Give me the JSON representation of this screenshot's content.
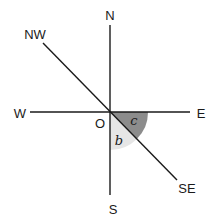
{
  "diagram": {
    "type": "compass-bearing",
    "center_label": "O",
    "directions": {
      "north": "N",
      "south": "S",
      "east": "E",
      "west": "W",
      "northwest": "NW",
      "southeast": "SE"
    },
    "angles": {
      "c": "c",
      "b": "b"
    },
    "colors": {
      "line": "#1a1a1a",
      "angle_c_fill": "#8c8c8c",
      "angle_b_fill": "#e6e6e6",
      "background": "#ffffff"
    }
  }
}
